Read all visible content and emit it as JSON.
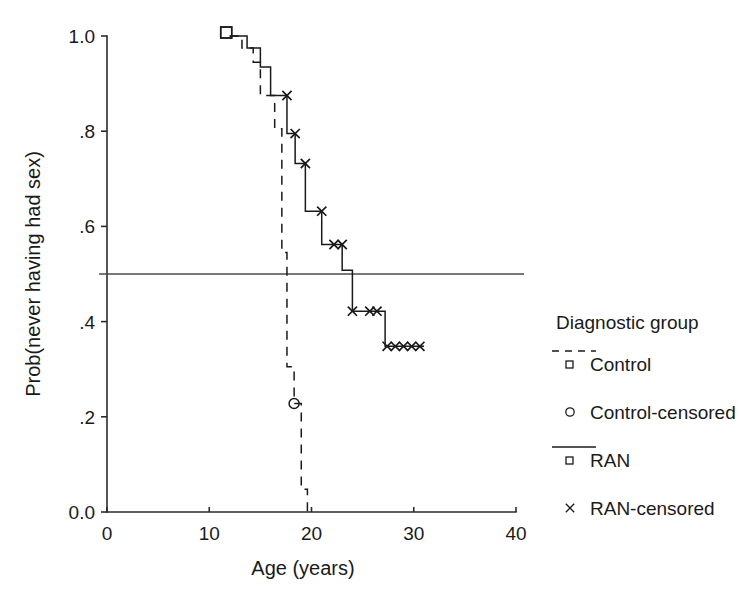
{
  "chart_data": {
    "type": "line",
    "subtype": "kaplan-meier-step",
    "title": "",
    "xlabel": "Age (years)",
    "ylabel": "Prob(never having had sex)",
    "xlim": [
      0,
      40
    ],
    "ylim": [
      0.0,
      1.0
    ],
    "xticks": [
      0,
      10,
      20,
      30,
      40
    ],
    "xtick_labels": [
      "0",
      "10",
      "20",
      "30",
      "40"
    ],
    "yticks": [
      0.0,
      0.2,
      0.4,
      0.6,
      0.8,
      1.0
    ],
    "ytick_labels": [
      "0.0",
      ".2",
      ".4",
      ".6",
      ".8",
      "1.0"
    ],
    "grid": false,
    "legend_position": "right",
    "reference_lines": [
      {
        "name": "median-reference",
        "orientation": "horizontal",
        "y": 0.5,
        "style": "solid"
      }
    ],
    "series": [
      {
        "name": "Control",
        "style": "dashed",
        "marker": "square-start",
        "censor_marker": "circle",
        "steps": [
          {
            "x": 12.0,
            "y": 1.0
          },
          {
            "x": 13.2,
            "y": 1.0
          },
          {
            "x": 13.2,
            "y": 0.975
          },
          {
            "x": 14.3,
            "y": 0.975
          },
          {
            "x": 14.3,
            "y": 0.945
          },
          {
            "x": 15.0,
            "y": 0.945
          },
          {
            "x": 15.0,
            "y": 0.875
          },
          {
            "x": 16.4,
            "y": 0.875
          },
          {
            "x": 16.4,
            "y": 0.805
          },
          {
            "x": 17.1,
            "y": 0.805
          },
          {
            "x": 17.1,
            "y": 0.545
          },
          {
            "x": 17.6,
            "y": 0.545
          },
          {
            "x": 17.6,
            "y": 0.305
          },
          {
            "x": 18.3,
            "y": 0.305
          },
          {
            "x": 18.3,
            "y": 0.228
          },
          {
            "x": 19.0,
            "y": 0.228
          },
          {
            "x": 19.0,
            "y": 0.048
          },
          {
            "x": 19.6,
            "y": 0.048
          },
          {
            "x": 19.6,
            "y": 0.0
          }
        ],
        "censored": [
          {
            "x": 18.3,
            "y": 0.228
          }
        ]
      },
      {
        "name": "RAN",
        "style": "solid",
        "marker": "square-start",
        "censor_marker": "x",
        "steps": [
          {
            "x": 12.0,
            "y": 1.0
          },
          {
            "x": 13.7,
            "y": 1.0
          },
          {
            "x": 13.7,
            "y": 0.975
          },
          {
            "x": 15.0,
            "y": 0.975
          },
          {
            "x": 15.0,
            "y": 0.935
          },
          {
            "x": 16.0,
            "y": 0.935
          },
          {
            "x": 16.0,
            "y": 0.875
          },
          {
            "x": 17.6,
            "y": 0.875
          },
          {
            "x": 17.6,
            "y": 0.795
          },
          {
            "x": 18.4,
            "y": 0.795
          },
          {
            "x": 18.4,
            "y": 0.732
          },
          {
            "x": 19.4,
            "y": 0.732
          },
          {
            "x": 19.4,
            "y": 0.632
          },
          {
            "x": 21.0,
            "y": 0.632
          },
          {
            "x": 21.0,
            "y": 0.562
          },
          {
            "x": 23.0,
            "y": 0.562
          },
          {
            "x": 23.0,
            "y": 0.508
          },
          {
            "x": 24.0,
            "y": 0.508
          },
          {
            "x": 24.0,
            "y": 0.422
          },
          {
            "x": 27.2,
            "y": 0.422
          },
          {
            "x": 27.2,
            "y": 0.348
          },
          {
            "x": 31.0,
            "y": 0.348
          }
        ],
        "censored": [
          {
            "x": 17.6,
            "y": 0.875
          },
          {
            "x": 18.4,
            "y": 0.795
          },
          {
            "x": 19.4,
            "y": 0.732
          },
          {
            "x": 21.0,
            "y": 0.632
          },
          {
            "x": 22.2,
            "y": 0.562
          },
          {
            "x": 23.0,
            "y": 0.562
          },
          {
            "x": 24.0,
            "y": 0.422
          },
          {
            "x": 25.7,
            "y": 0.422
          },
          {
            "x": 26.4,
            "y": 0.422
          },
          {
            "x": 27.4,
            "y": 0.348
          },
          {
            "x": 28.2,
            "y": 0.348
          },
          {
            "x": 29.0,
            "y": 0.348
          },
          {
            "x": 29.8,
            "y": 0.348
          },
          {
            "x": 30.6,
            "y": 0.348
          }
        ]
      }
    ]
  },
  "legend": {
    "title": "Diagnostic group",
    "entries": [
      {
        "label": "Control",
        "key": "dashed-line",
        "mark": "square"
      },
      {
        "label": "Control-censored",
        "key": "none",
        "mark": "circle"
      },
      {
        "label": "RAN",
        "key": "solid-line",
        "mark": "square"
      },
      {
        "label": "RAN-censored",
        "key": "none",
        "mark": "x"
      }
    ]
  }
}
